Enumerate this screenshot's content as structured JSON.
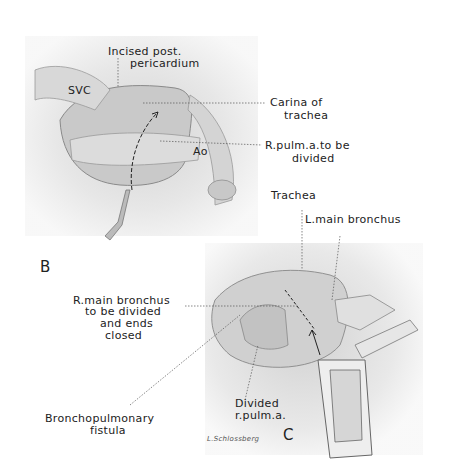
{
  "figure": {
    "panels": [
      {
        "id": "B",
        "letter": "B",
        "labels": {
          "incised_line1": "Incised post.",
          "incised_line2": "pericardium",
          "svc": "SVC",
          "carina_line1": "Carina of",
          "carina_line2": "trachea",
          "ao": "Ao",
          "rpulm_line1": "R.pulm.a.to be",
          "rpulm_line2": "divided"
        }
      },
      {
        "id": "C",
        "letter": "C",
        "labels": {
          "trachea": "Trachea",
          "lmain": "L.main bronchus",
          "rmain_line1": "R.main bronchus",
          "rmain_line2": "to be divided",
          "rmain_line3": "and ends",
          "rmain_line4": "closed",
          "divided_line1": "Divided",
          "divided_line2": "r.pulm.a.",
          "fistula_line1": "Bronchopulmonary",
          "fistula_line2": "fistula"
        },
        "signature": "L.Schlossberg"
      }
    ]
  }
}
